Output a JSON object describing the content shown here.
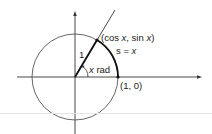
{
  "diagram": {
    "labels": {
      "radius": "1",
      "point_open": "(cos ",
      "point_x1": "x",
      "point_mid": ", sin ",
      "point_x2": "x",
      "point_close": ")",
      "arc_s": "s",
      "arc_eq": " = ",
      "arc_x": "x",
      "angle_x": "x",
      "angle_unit": " rad",
      "point_on_axis": "(1, 0)"
    },
    "colors": {
      "stroke": "#333333",
      "circle": "#555555",
      "separator": "#e4e4e4"
    }
  }
}
